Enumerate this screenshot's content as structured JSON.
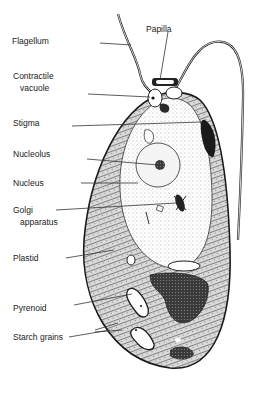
{
  "figure": {
    "labels": [
      {
        "id": "flagellum",
        "text": "Flagellum"
      },
      {
        "id": "papilla",
        "text": "Papilla"
      },
      {
        "id": "contractile-vacuole",
        "line1": "Contractile",
        "line2": "vacuole"
      },
      {
        "id": "stigma",
        "text": "Stigma"
      },
      {
        "id": "nucleolus",
        "text": "Nucleolus"
      },
      {
        "id": "nucleus",
        "text": "Nucleus"
      },
      {
        "id": "golgi-apparatus",
        "line1": "Golgi",
        "line2": "apparatus"
      },
      {
        "id": "plastid",
        "text": "Plastid"
      },
      {
        "id": "pyrenoid",
        "text": "Pyrenoid"
      },
      {
        "id": "starch-grains",
        "text": "Starch grains"
      }
    ]
  }
}
